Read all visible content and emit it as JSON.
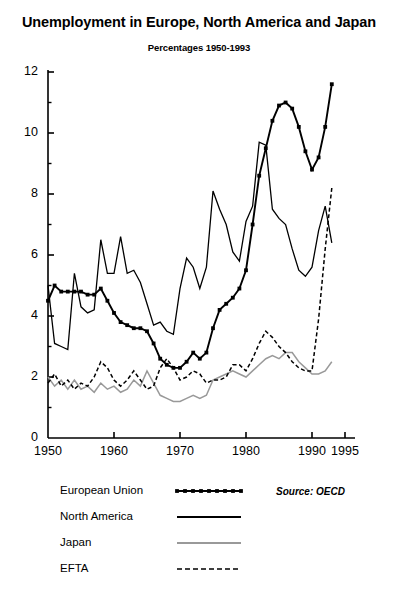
{
  "chart_data": {
    "type": "line",
    "title": "Unemployment in Europe, North America and Japan",
    "subtitle": "Percentages 1950-1993",
    "xlabel": "",
    "ylabel": "",
    "source": "Source: OECD",
    "grid": false,
    "legend_position": "below-left",
    "xlim": [
      1950,
      1995
    ],
    "ylim": [
      0,
      12
    ],
    "x_ticks": [
      1950,
      1960,
      1970,
      1980,
      1990,
      1995
    ],
    "y_ticks": [
      0,
      2,
      4,
      6,
      8,
      10,
      12
    ],
    "y_minor_ticks": [
      1,
      3,
      5,
      7,
      9,
      11
    ],
    "x": [
      1950,
      1951,
      1952,
      1953,
      1954,
      1955,
      1956,
      1957,
      1958,
      1959,
      1960,
      1961,
      1962,
      1963,
      1964,
      1965,
      1966,
      1967,
      1968,
      1969,
      1970,
      1971,
      1972,
      1973,
      1974,
      1975,
      1976,
      1977,
      1978,
      1979,
      1980,
      1981,
      1982,
      1983,
      1984,
      1985,
      1986,
      1987,
      1988,
      1989,
      1990,
      1991,
      1992,
      1993
    ],
    "series": [
      {
        "name": "European Union",
        "style": "line-markers",
        "color": "#000000",
        "values": [
          4.5,
          5.0,
          4.8,
          4.8,
          4.8,
          4.8,
          4.7,
          4.7,
          4.9,
          4.5,
          4.1,
          3.8,
          3.7,
          3.6,
          3.6,
          3.5,
          3.1,
          2.6,
          2.4,
          2.3,
          2.3,
          2.5,
          2.8,
          2.6,
          2.8,
          3.6,
          4.2,
          4.4,
          4.6,
          4.9,
          5.5,
          7.0,
          8.6,
          9.5,
          10.4,
          10.9,
          11.0,
          10.8,
          10.2,
          9.4,
          8.8,
          9.2,
          10.2,
          11.6
        ]
      },
      {
        "name": "North America",
        "style": "solid",
        "color": "#000000",
        "values": [
          5.0,
          3.1,
          3.0,
          2.9,
          5.4,
          4.3,
          4.1,
          4.2,
          6.5,
          5.4,
          5.4,
          6.6,
          5.4,
          5.5,
          5.1,
          4.4,
          3.7,
          3.8,
          3.5,
          3.4,
          4.9,
          5.9,
          5.6,
          4.9,
          5.6,
          8.1,
          7.5,
          7.0,
          6.1,
          5.8,
          7.1,
          7.6,
          9.7,
          9.6,
          7.5,
          7.2,
          7.0,
          6.2,
          5.5,
          5.3,
          5.6,
          6.8,
          7.6,
          6.4
        ]
      },
      {
        "name": "Japan",
        "style": "solid",
        "color": "#999999",
        "values": [
          2.0,
          1.7,
          1.9,
          1.6,
          1.9,
          1.6,
          1.7,
          1.5,
          1.8,
          1.6,
          1.7,
          1.5,
          1.6,
          1.9,
          1.7,
          2.2,
          1.8,
          1.4,
          1.3,
          1.2,
          1.2,
          1.3,
          1.4,
          1.3,
          1.4,
          1.9,
          2.0,
          2.1,
          2.2,
          2.1,
          2.0,
          2.2,
          2.4,
          2.6,
          2.7,
          2.6,
          2.8,
          2.8,
          2.5,
          2.3,
          2.1,
          2.1,
          2.2,
          2.5
        ]
      },
      {
        "name": "EFTA",
        "style": "dashed",
        "color": "#000000",
        "values": [
          1.8,
          2.1,
          1.7,
          1.9,
          1.6,
          1.8,
          1.7,
          2.0,
          2.5,
          2.3,
          1.9,
          1.7,
          1.9,
          2.2,
          1.9,
          1.6,
          1.7,
          2.3,
          2.6,
          2.3,
          1.9,
          2.0,
          2.2,
          2.1,
          1.8,
          1.9,
          1.9,
          2.0,
          2.4,
          2.4,
          2.2,
          2.6,
          3.1,
          3.5,
          3.3,
          3.0,
          2.8,
          2.5,
          2.3,
          2.2,
          2.2,
          3.9,
          6.2,
          8.2
        ]
      }
    ]
  },
  "legend": {
    "items": [
      {
        "label": "European Union"
      },
      {
        "label": "North America"
      },
      {
        "label": "Japan"
      },
      {
        "label": "EFTA"
      }
    ]
  },
  "axes": {
    "y_tick_labels": [
      "0",
      "2",
      "4",
      "6",
      "8",
      "10",
      "12"
    ],
    "x_tick_labels": [
      "1950",
      "1960",
      "1970",
      "1980",
      "1990",
      "1995"
    ]
  }
}
